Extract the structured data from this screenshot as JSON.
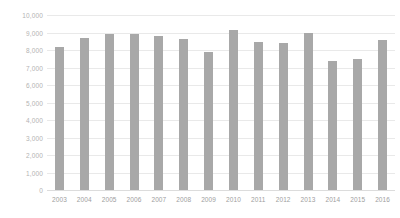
{
  "chart_data": {
    "type": "bar",
    "title": "",
    "subtitle": "",
    "xlabel": "",
    "ylabel": "",
    "categories": [
      "2003",
      "2004",
      "2005",
      "2006",
      "2007",
      "2008",
      "2009",
      "2010",
      "2011",
      "2012",
      "2013",
      "2014",
      "2015",
      "2016"
    ],
    "values": [
      8150,
      8700,
      8900,
      8930,
      8800,
      8620,
      7900,
      9150,
      8450,
      8400,
      8950,
      7400,
      7500,
      8600
    ],
    "ylim": [
      0,
      10000
    ],
    "ytick_values": [
      0,
      1000,
      2000,
      3000,
      4000,
      5000,
      6000,
      7000,
      8000,
      9000,
      10000
    ],
    "ytick_labels": [
      "0",
      "1,000",
      "2,000",
      "3,000",
      "4,000",
      "5,000",
      "6,000",
      "7,000",
      "8,000",
      "9,000",
      "10,000"
    ],
    "grid": true,
    "legend": false,
    "legend_position": "none",
    "annotations": [],
    "colors": {
      "bar": "#a8a8a8",
      "gridline": "#e9e9e9",
      "baseline": "#dcdcdc",
      "ytick_label": "#b3b3b3",
      "xtick_label": "#9e9e9e",
      "background": "#ffffff"
    }
  }
}
